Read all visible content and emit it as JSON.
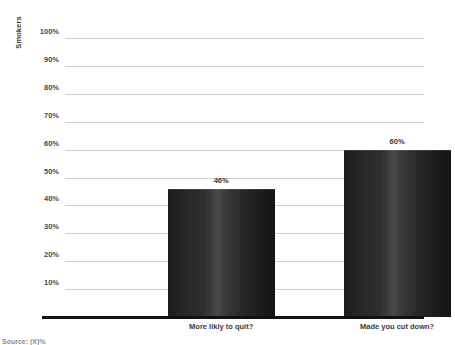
{
  "chart_data": {
    "type": "bar",
    "title": "",
    "subtitle": "",
    "xlabel": "",
    "ylabel": "Smokers",
    "categories": [
      "More likly to quit?",
      "Made you cut down?"
    ],
    "values": [
      46,
      60
    ],
    "value_labels": [
      "46%",
      "60%"
    ],
    "ylim": [
      0,
      100
    ],
    "ytick_values": [
      10,
      20,
      30,
      40,
      50,
      60,
      70,
      80,
      90,
      100
    ],
    "ytick_labels": [
      "10%",
      "20%",
      "30%",
      "40%",
      "50%",
      "60%",
      "70%",
      "80%",
      "90%",
      "100%"
    ],
    "grid": true,
    "legend": false,
    "bar_color": "#2b2b2b",
    "grid_color": "#cfcfcf",
    "axis_color": "#111111"
  },
  "footer": {
    "source_note": "Source: (X)%"
  }
}
